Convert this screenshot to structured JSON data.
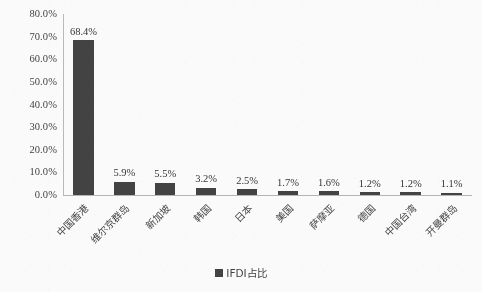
{
  "chart_data": {
    "type": "bar",
    "title": "",
    "subtitle": "",
    "xlabel": "",
    "ylabel": "",
    "ylim": [
      0,
      80
    ],
    "grid": false,
    "legend_position": "bottom",
    "categories": [
      "中国香港",
      "维尔京群岛",
      "新加坡",
      "韩国",
      "日本",
      "美国",
      "萨摩亚",
      "德国",
      "中国台湾",
      "开曼群岛"
    ],
    "values": [
      68.4,
      5.9,
      5.5,
      3.2,
      2.5,
      1.7,
      1.6,
      1.2,
      1.2,
      1.1
    ],
    "value_labels": [
      "68.4%",
      "5.9%",
      "5.5%",
      "3.2%",
      "2.5%",
      "1.7%",
      "1.6%",
      "1.2%",
      "1.2%",
      "1.1%"
    ],
    "series": [
      {
        "name": "IFDI占比",
        "values": [
          68.4,
          5.9,
          5.5,
          3.2,
          2.5,
          1.7,
          1.6,
          1.2,
          1.2,
          1.1
        ],
        "color": "#3d3d3d"
      }
    ],
    "y_ticks": [
      80,
      70,
      60,
      50,
      40,
      30,
      20,
      10,
      0
    ],
    "y_tick_labels": [
      "80.0%",
      "70.0%",
      "60.0%",
      "50.0%",
      "40.0%",
      "30.0%",
      "20.0%",
      "10.0%",
      "0.0%"
    ]
  },
  "legend": {
    "entries": [
      {
        "label": "IFDI占比",
        "color": "#3d3d3d"
      }
    ]
  },
  "colors": {
    "bar": "#3d3d3d",
    "axis": "#b6b6b6",
    "text": "#3a3a3a",
    "background": "#fefefe"
  }
}
